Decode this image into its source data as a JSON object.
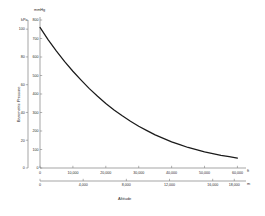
{
  "chart_data": {
    "type": "line",
    "title": "",
    "xlabel": "Altitude",
    "ylabel": "Barometric Pressure",
    "grid": false,
    "legend": "none",
    "line_color": "#1a1a1a",
    "axis_color": "#808080",
    "y_axes": [
      {
        "name": "kPa",
        "unit": "kPa",
        "position": "outer-left",
        "ticks": [
          0,
          20,
          40,
          60,
          80,
          100
        ],
        "tick_labels": [
          "0",
          "20",
          "40",
          "60",
          "80",
          "100"
        ],
        "ylim": [
          0,
          106.6
        ]
      },
      {
        "name": "mmHg",
        "unit": "mmHg",
        "position": "inner-left",
        "ticks": [
          0,
          100,
          200,
          300,
          400,
          500,
          600,
          700,
          800
        ],
        "tick_labels": [
          "0",
          "100",
          "200",
          "300",
          "400",
          "500",
          "600",
          "700",
          "800"
        ],
        "ylim": [
          0,
          800
        ]
      }
    ],
    "x_axes": [
      {
        "name": "feet",
        "unit": "ft",
        "position": "upper",
        "ticks": [
          0,
          10000,
          20000,
          30000,
          40000,
          50000,
          60000
        ],
        "tick_labels": [
          "0",
          "10,000",
          "20,000",
          "30,000",
          "40,000",
          "50,000",
          "60,000"
        ],
        "xlim": [
          0,
          62000
        ]
      },
      {
        "name": "meters",
        "unit": "m",
        "position": "lower",
        "ticks": [
          0,
          4000,
          8000,
          12000,
          16000,
          18000
        ],
        "tick_labels": [
          "0",
          "4,000",
          "8,000",
          "12,000",
          "16,000",
          "18,000"
        ],
        "xlim": [
          0,
          18900
        ]
      }
    ],
    "series": [
      {
        "name": "Barometric pressure",
        "x_unit": "ft",
        "y_unit": "mmHg",
        "x": [
          0,
          2500,
          5000,
          7500,
          10000,
          12500,
          15000,
          17500,
          20000,
          22500,
          25000,
          27500,
          30000,
          32500,
          35000,
          37500,
          40000,
          42500,
          45000,
          47500,
          50000,
          52500,
          55000,
          57500,
          60000
        ],
        "y": [
          760,
          693,
          632,
          575,
          523,
          475,
          429,
          388,
          349,
          314,
          282,
          253,
          226,
          202,
          179,
          160,
          141,
          126,
          111,
          99,
          87,
          78,
          68,
          61,
          54
        ]
      }
    ]
  },
  "labels": {
    "kpa_unit": "kPa",
    "mmhg_unit": "mmHg",
    "ft_unit": "ft",
    "m_unit": "m",
    "x_title": "Altitude",
    "y_title": "Barometric Pressure"
  }
}
